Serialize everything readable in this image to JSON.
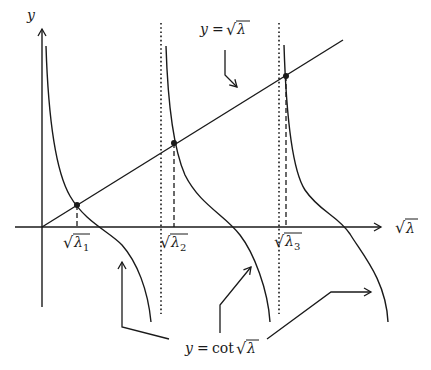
{
  "diagram": {
    "axes": {
      "y_label": "y",
      "x_label_radical": "√",
      "x_label_var": "λ"
    },
    "line_label": {
      "lhs": "y",
      "eq": "=",
      "radical": "√",
      "var": "λ"
    },
    "curve_label": {
      "lhs": "y",
      "eq": "=",
      "func": "cot",
      "radical": "√",
      "var": "λ"
    },
    "roots": [
      {
        "radical": "√",
        "var": "λ",
        "sub": "1"
      },
      {
        "radical": "√",
        "var": "λ",
        "sub": "2"
      },
      {
        "radical": "√",
        "var": "λ",
        "sub": "3"
      }
    ],
    "colors": {
      "ink": "#1a1a1a",
      "background": "#ffffff"
    }
  }
}
